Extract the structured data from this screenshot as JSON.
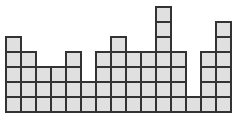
{
  "diagram": {
    "type": "block-column-grid",
    "cell_size": 15,
    "origin_x": 5,
    "baseline_y": 111,
    "cell_fill": "#e0e0e0",
    "cell_stroke": "#333333",
    "column_heights": [
      5,
      4,
      3,
      3,
      4,
      2,
      4,
      5,
      4,
      4,
      7,
      4,
      1,
      4,
      6
    ]
  }
}
